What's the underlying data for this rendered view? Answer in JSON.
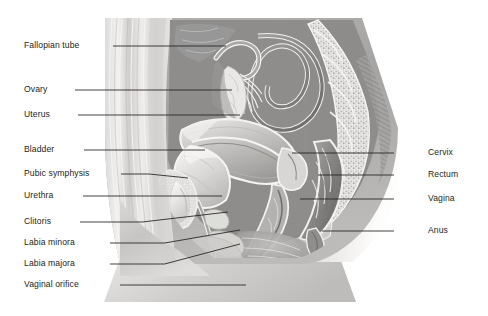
{
  "figure": {
    "type": "anatomical-illustration",
    "style": "grayscale-airbrush",
    "colors": {
      "background": "#ffffff",
      "label_text": "#231f20",
      "leader_line": "#231f20",
      "skin_light": "#e8e7e5",
      "skin_mid": "#d2d1cf",
      "skin_shadow": "#b9b8b6",
      "tissue_dark": "#8d8c8b",
      "tissue_mid": "#a9a8a7",
      "organ_light": "#e2e1df",
      "bone_light": "#efeeec",
      "cavity_dark": "#7a7978"
    }
  },
  "labels": {
    "left": [
      {
        "id": "fallopian-tube",
        "text": "Fallopian tube",
        "text_x": 24,
        "text_y": 46,
        "line_from_x": 113,
        "line_from_y": 46,
        "line_to_x": 226,
        "line_to_y": 46,
        "bend": false
      },
      {
        "id": "ovary",
        "text": "Ovary",
        "text_x": 24,
        "text_y": 90,
        "line_from_x": 75,
        "line_from_y": 90,
        "line_to_x": 232,
        "line_to_y": 90,
        "bend": false
      },
      {
        "id": "uterus",
        "text": "Uterus",
        "text_x": 24,
        "text_y": 115,
        "line_from_x": 78,
        "line_from_y": 115,
        "line_to_x": 240,
        "line_to_y": 115,
        "bend": false
      },
      {
        "id": "bladder",
        "text": "Bladder",
        "text_x": 24,
        "text_y": 150,
        "line_from_x": 84,
        "line_from_y": 150,
        "line_to_x": 205,
        "line_to_y": 150,
        "bend": false
      },
      {
        "id": "pubic-symphysis",
        "text": "Pubic symphysis",
        "text_x": 24,
        "text_y": 174,
        "line_from_x": 121,
        "line_from_y": 174,
        "line_to_x": 188,
        "line_to_y": 178,
        "bend": true
      },
      {
        "id": "urethra",
        "text": "Urethra",
        "text_x": 24,
        "text_y": 196,
        "line_from_x": 83,
        "line_from_y": 196,
        "line_to_x": 222,
        "line_to_y": 196,
        "bend": false
      },
      {
        "id": "clitoris",
        "text": "Clitoris",
        "text_x": 24,
        "text_y": 222,
        "line_from_x": 80,
        "line_from_y": 222,
        "line_to_x": 228,
        "line_to_y": 212,
        "bend": true
      },
      {
        "id": "labia-minora",
        "text": "Labia minora",
        "text_x": 24,
        "text_y": 243,
        "line_from_x": 110,
        "line_from_y": 243,
        "line_to_x": 240,
        "line_to_y": 230,
        "bend": true
      },
      {
        "id": "labia-majora",
        "text": "Labia majora",
        "text_x": 24,
        "text_y": 264,
        "line_from_x": 110,
        "line_from_y": 264,
        "line_to_x": 240,
        "line_to_y": 244,
        "bend": true
      },
      {
        "id": "vaginal-orifice",
        "text": "Vaginal orifice",
        "text_x": 24,
        "text_y": 285,
        "line_from_x": 120,
        "line_from_y": 285,
        "line_to_x": 246,
        "line_to_y": 285,
        "bend": true
      }
    ],
    "right": [
      {
        "id": "cervix",
        "text": "Cervix",
        "text_x": 428,
        "text_y": 153,
        "line_from_x": 394,
        "line_from_y": 153,
        "line_to_x": 292,
        "line_to_y": 153
      },
      {
        "id": "rectum",
        "text": "Rectum",
        "text_x": 428,
        "text_y": 175,
        "line_from_x": 394,
        "line_from_y": 175,
        "line_to_x": 318,
        "line_to_y": 175
      },
      {
        "id": "vagina",
        "text": "Vagina",
        "text_x": 428,
        "text_y": 199,
        "line_from_x": 394,
        "line_from_y": 199,
        "line_to_x": 300,
        "line_to_y": 199
      },
      {
        "id": "anus",
        "text": "Anus",
        "text_x": 428,
        "text_y": 231,
        "line_from_x": 394,
        "line_from_y": 231,
        "line_to_x": 322,
        "line_to_y": 231
      }
    ]
  }
}
